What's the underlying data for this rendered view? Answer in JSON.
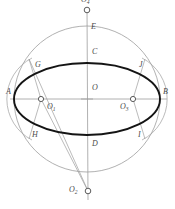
{
  "figure": {
    "background_color": "#ffffff",
    "outline_color": "#8a8a8a",
    "thick_curve_color": "#1a1a1a",
    "construction_line_color": "#9a9a9a",
    "axis_color": "#9a9a9a",
    "label_color": "#4a4a4a",
    "marker_fill": "#ffffff",
    "marker_stroke": "#555555"
  },
  "labels": {
    "a": "A",
    "b": "B",
    "c": "C",
    "d": "D",
    "e": "E",
    "g": "G",
    "h": "H",
    "i": "I",
    "j": "J",
    "o": "O",
    "o1": "O",
    "o1_sub": "1",
    "o2": "O",
    "o2_sub": "2",
    "o3": "O",
    "o3_sub": "3",
    "o4": "O",
    "o4_sub": "4"
  },
  "geometry": {
    "sphere_center_x": 87,
    "sphere_center_y": 99,
    "sphere_radius_x": 73,
    "sphere_radius_y": 73,
    "ellipse_center_x": 87,
    "ellipse_center_y": 99,
    "ellipse_radius_x": 73,
    "ellipse_radius_y": 36,
    "pole_top_x": 87,
    "pole_top_y": 10,
    "pole_bottom_x": 88,
    "pole_bottom_y": 191,
    "o1_x": 41,
    "o1_y": 99,
    "o3_x": 133,
    "o3_y": 99
  }
}
